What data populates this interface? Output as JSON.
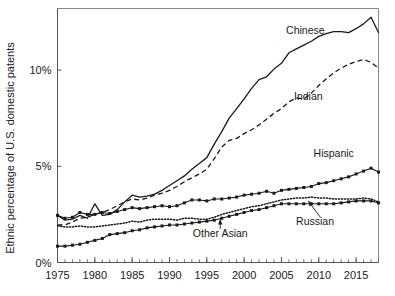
{
  "chart_data": {
    "type": "line",
    "title": "",
    "xlabel": "",
    "ylabel": "Ethnic percentage of U.S. domestic patents",
    "xlim": [
      1975,
      2018
    ],
    "ylim": [
      0,
      13.2
    ],
    "grid": false,
    "legend_position": "inline-labels",
    "x_tick_labels": [
      "1975",
      "1980",
      "1985",
      "1990",
      "1995",
      "2000",
      "2005",
      "2010",
      "2015"
    ],
    "x_tick_values": [
      1975,
      1980,
      1985,
      1990,
      1995,
      2000,
      2005,
      2010,
      2015
    ],
    "x_minor_tick_step": 1,
    "y_tick_labels": [
      "0%",
      "5%",
      "10%"
    ],
    "y_tick_values": [
      0,
      5,
      10
    ],
    "x": [
      1975,
      1976,
      1977,
      1978,
      1979,
      1980,
      1981,
      1982,
      1983,
      1984,
      1985,
      1986,
      1987,
      1988,
      1989,
      1990,
      1991,
      1992,
      1993,
      1994,
      1995,
      1996,
      1997,
      1998,
      1999,
      2000,
      2001,
      2002,
      2003,
      2004,
      2005,
      2006,
      2007,
      2008,
      2009,
      2010,
      2011,
      2012,
      2013,
      2014,
      2015,
      2016,
      2017,
      2018
    ],
    "series": [
      {
        "name": "Chinese",
        "style": "solid",
        "markers": false,
        "label": "Chinese",
        "label_x": 2008.2,
        "label_y": 11.9,
        "values": [
          2.45,
          2.2,
          2.25,
          2.45,
          2.3,
          3.05,
          2.45,
          2.5,
          2.75,
          3.15,
          3.5,
          3.4,
          3.45,
          3.55,
          3.75,
          4.0,
          4.25,
          4.5,
          4.85,
          5.15,
          5.45,
          6.15,
          6.8,
          7.5,
          8.0,
          8.5,
          9.05,
          9.5,
          9.65,
          10.05,
          10.35,
          10.9,
          11.1,
          11.3,
          11.5,
          11.75,
          11.9,
          12.0,
          12.0,
          11.95,
          12.15,
          12.4,
          12.75,
          11.95
        ]
      },
      {
        "name": "Indian",
        "style": "dashed",
        "markers": false,
        "label": "Indian",
        "label_x": 2008.6,
        "label_y": 8.45,
        "values": [
          1.95,
          1.95,
          2.1,
          2.3,
          2.35,
          2.5,
          2.6,
          2.75,
          2.95,
          3.15,
          3.3,
          3.25,
          3.35,
          3.5,
          3.6,
          3.75,
          3.95,
          4.2,
          4.4,
          4.6,
          4.85,
          5.4,
          6.0,
          6.35,
          6.45,
          6.7,
          6.9,
          7.15,
          7.45,
          7.75,
          8.0,
          8.35,
          8.55,
          8.5,
          8.8,
          9.2,
          9.55,
          9.85,
          10.1,
          10.3,
          10.45,
          10.55,
          10.4,
          10.1
        ]
      },
      {
        "name": "Hispanic",
        "style": "solid",
        "markers": true,
        "label": "Hispanic",
        "label_x": 2012.0,
        "label_y": 5.5,
        "values": [
          2.45,
          2.3,
          2.35,
          2.6,
          2.5,
          2.5,
          2.6,
          2.55,
          2.65,
          2.75,
          2.85,
          2.8,
          2.85,
          2.9,
          2.95,
          2.9,
          2.95,
          3.1,
          3.25,
          3.25,
          3.2,
          3.3,
          3.3,
          3.35,
          3.4,
          3.5,
          3.55,
          3.6,
          3.7,
          3.6,
          3.75,
          3.8,
          3.85,
          3.9,
          3.95,
          4.1,
          4.15,
          4.25,
          4.35,
          4.45,
          4.6,
          4.75,
          4.9,
          4.7
        ]
      },
      {
        "name": "Russian",
        "style": "dotted",
        "markers": false,
        "label": "Russian",
        "label_x": 2009.5,
        "label_y": 1.95,
        "values": [
          1.9,
          1.85,
          1.85,
          1.9,
          1.85,
          1.85,
          1.9,
          1.95,
          2.0,
          2.05,
          2.15,
          2.1,
          2.2,
          2.25,
          2.25,
          2.25,
          2.2,
          2.3,
          2.3,
          2.25,
          2.25,
          2.35,
          2.5,
          2.6,
          2.7,
          2.8,
          2.9,
          2.95,
          3.05,
          3.15,
          3.25,
          3.3,
          3.35,
          3.35,
          3.4,
          3.35,
          3.35,
          3.3,
          3.3,
          3.3,
          3.3,
          3.35,
          3.3,
          3.15
        ]
      },
      {
        "name": "Other Asian",
        "style": "solid",
        "markers": true,
        "label": "Other Asian",
        "label_x": 1996.8,
        "label_y": 1.35,
        "values": [
          0.85,
          0.85,
          0.9,
          0.95,
          1.05,
          1.15,
          1.25,
          1.45,
          1.5,
          1.55,
          1.65,
          1.7,
          1.8,
          1.85,
          1.9,
          1.95,
          1.95,
          2.0,
          2.05,
          2.1,
          2.15,
          2.2,
          2.3,
          2.4,
          2.5,
          2.6,
          2.7,
          2.75,
          2.85,
          2.95,
          3.05,
          3.05,
          3.05,
          3.05,
          3.05,
          3.05,
          3.05,
          3.05,
          3.1,
          3.15,
          3.2,
          3.2,
          3.2,
          3.1
        ]
      }
    ],
    "annotations": [
      {
        "name": "russian-leader",
        "text": "Russian",
        "from_x": 2010.2,
        "from_y": 2.35,
        "to_x": 2008.6,
        "to_y": 3.2
      },
      {
        "name": "other-asian-leader",
        "text": "Other Asian",
        "from_x": 1996.8,
        "from_y": 1.75,
        "to_x": 1996.8,
        "to_y": 2.25
      }
    ]
  },
  "figure": {
    "plot_background": "#ffffff",
    "line_color": "#1a1a1a",
    "frame_color": "#8a8a8a"
  }
}
